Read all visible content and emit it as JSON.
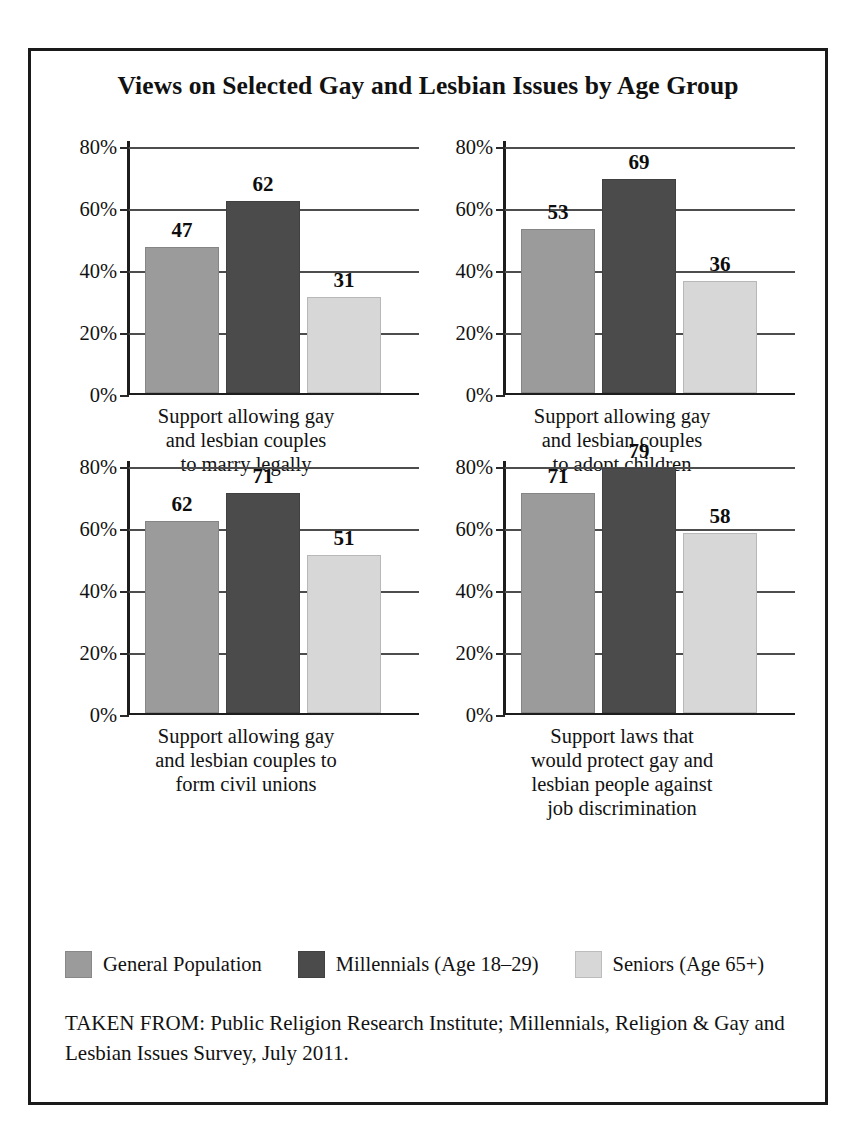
{
  "figure": {
    "title": "Views on Selected Gay and Lesbian Issues by Age Group",
    "source_note": "TAKEN FROM: Public Religion Research Institute; Millennials, Religion & Gay and Lesbian Issues Survey, July 2011."
  },
  "legend": {
    "items": [
      {
        "label": "General Population",
        "color": "#9b9b9b"
      },
      {
        "label": "Millennials (Age 18–29)",
        "color": "#4b4b4b"
      },
      {
        "label": "Seniors (Age 65+)",
        "color": "#d7d7d7"
      }
    ]
  },
  "axis": {
    "ticks": [
      "80%",
      "60%",
      "40%",
      "20%",
      "0%"
    ],
    "tick_values": [
      80,
      60,
      40,
      20,
      0
    ],
    "ylim": [
      0,
      80
    ]
  },
  "panels": [
    {
      "caption_lines": [
        "Support allowing gay",
        "and lesbian couples",
        "to marry legally"
      ],
      "values": [
        47,
        62,
        31
      ]
    },
    {
      "caption_lines": [
        "Support allowing gay",
        "and lesbian couples",
        "to adopt children"
      ],
      "values": [
        53,
        69,
        36
      ]
    },
    {
      "caption_lines": [
        "Support allowing gay",
        "and lesbian couples to",
        "form civil unions"
      ],
      "values": [
        62,
        71,
        51
      ]
    },
    {
      "caption_lines": [
        "Support laws that",
        "would protect gay and",
        "lesbian people against",
        "job discrimination"
      ],
      "values": [
        71,
        79,
        58
      ]
    }
  ],
  "chart_data": {
    "type": "bar",
    "title": "Views on Selected Gay and Lesbian Issues by Age Group",
    "xlabel": "",
    "ylabel": "",
    "ylim": [
      0,
      80
    ],
    "ytick_labels": [
      "0%",
      "20%",
      "40%",
      "60%",
      "80%"
    ],
    "grid": true,
    "legend_position": "bottom",
    "series_names": [
      "General Population",
      "Millennials (Age 18–29)",
      "Seniors (Age 65+)"
    ],
    "series_colors": [
      "#9b9b9b",
      "#4b4b4b",
      "#d7d7d7"
    ],
    "panels": [
      {
        "categories": [
          "Support allowing gay and lesbian couples to marry legally"
        ],
        "series": [
          {
            "name": "General Population",
            "values": [
              47
            ]
          },
          {
            "name": "Millennials (Age 18–29)",
            "values": [
              62
            ]
          },
          {
            "name": "Seniors (Age 65+)",
            "values": [
              31
            ]
          }
        ]
      },
      {
        "categories": [
          "Support allowing gay and lesbian couples to adopt children"
        ],
        "series": [
          {
            "name": "General Population",
            "values": [
              53
            ]
          },
          {
            "name": "Millennials (Age 18–29)",
            "values": [
              69
            ]
          },
          {
            "name": "Seniors (Age 65+)",
            "values": [
              36
            ]
          }
        ]
      },
      {
        "categories": [
          "Support allowing gay and lesbian couples to form civil unions"
        ],
        "series": [
          {
            "name": "General Population",
            "values": [
              62
            ]
          },
          {
            "name": "Millennials (Age 18–29)",
            "values": [
              71
            ]
          },
          {
            "name": "Seniors (Age 65+)",
            "values": [
              51
            ]
          }
        ]
      },
      {
        "categories": [
          "Support laws that would protect gay and lesbian people against job discrimination"
        ],
        "series": [
          {
            "name": "General Population",
            "values": [
              71
            ]
          },
          {
            "name": "Millennials (Age 18–29)",
            "values": [
              79
            ]
          },
          {
            "name": "Seniors (Age 65+)",
            "values": [
              58
            ]
          }
        ]
      }
    ],
    "annotations": [
      "TAKEN FROM: Public Religion Research Institute; Millennials, Religion & Gay and Lesbian Issues Survey, July 2011."
    ]
  }
}
